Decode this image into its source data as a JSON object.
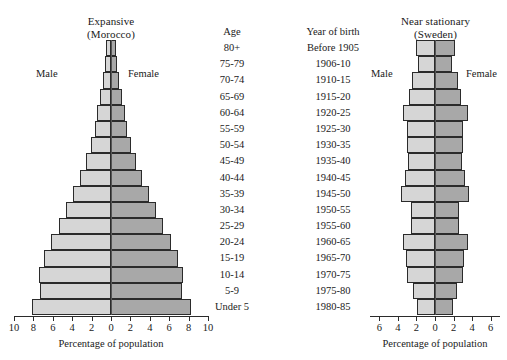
{
  "chart_data": {
    "type": "bar",
    "orientation": "horizontal-diverging",
    "panels": [
      {
        "id": "morocco",
        "title_line1": "Expansive",
        "title_line2": "(Morocco)",
        "male_label": "Male",
        "female_label": "Female",
        "xlabel": "Percentage of population",
        "xlim": [
          -10,
          10
        ],
        "xticks": [
          10,
          8,
          6,
          4,
          2,
          0,
          2,
          4,
          6,
          8,
          10
        ],
        "xtick_values": [
          -10,
          -8,
          -6,
          -4,
          -2,
          0,
          2,
          4,
          6,
          8,
          10
        ],
        "grid": false,
        "series": [
          {
            "name": "Male",
            "color": "#d6d6d6"
          },
          {
            "name": "Female",
            "color": "#a8a8a8"
          }
        ],
        "categories": [
          "80+",
          "75-79",
          "70-74",
          "65-69",
          "60-64",
          "55-59",
          "50-54",
          "45-49",
          "40-44",
          "35-39",
          "30-34",
          "25-29",
          "20-24",
          "15-19",
          "10-14",
          "5-9",
          "Under 5"
        ],
        "male_values": [
          0.5,
          0.6,
          0.8,
          1.1,
          1.4,
          1.7,
          2.1,
          2.6,
          3.2,
          3.9,
          4.6,
          5.4,
          6.2,
          6.9,
          7.4,
          7.3,
          8.1
        ],
        "female_values": [
          0.5,
          0.6,
          0.8,
          1.1,
          1.4,
          1.7,
          2.1,
          2.6,
          3.2,
          3.9,
          4.6,
          5.4,
          6.2,
          6.9,
          7.4,
          7.3,
          8.2
        ]
      },
      {
        "id": "sweden",
        "title_line1": "Near stationary",
        "title_line2": "(Sweden)",
        "male_label": "Male",
        "female_label": "Female",
        "xlabel": "Percentage of population",
        "xlim": [
          -7,
          7
        ],
        "xticks": [
          6,
          4,
          2,
          0,
          2,
          4,
          6
        ],
        "xtick_values": [
          -6,
          -4,
          -2,
          0,
          2,
          4,
          6
        ],
        "grid": false,
        "series": [
          {
            "name": "Male",
            "color": "#d6d6d6"
          },
          {
            "name": "Female",
            "color": "#a8a8a8"
          }
        ],
        "categories": [
          "Before 1905",
          "1906-10",
          "1910-15",
          "1915-20",
          "1920-25",
          "1925-30",
          "1930-35",
          "1935-40",
          "1940-45",
          "1945-50",
          "1950-55",
          "1955-60",
          "1960-65",
          "1965-70",
          "1970-75",
          "1975-80",
          "1980-85"
        ],
        "male_values": [
          2.1,
          1.8,
          2.5,
          2.8,
          3.5,
          3.0,
          3.0,
          2.9,
          3.2,
          3.7,
          2.6,
          2.6,
          3.5,
          3.1,
          3.0,
          2.4,
          1.9
        ],
        "female_values": [
          2.1,
          1.8,
          2.5,
          2.8,
          3.5,
          3.0,
          3.0,
          2.9,
          3.2,
          3.7,
          2.6,
          2.6,
          3.5,
          3.1,
          3.0,
          2.4,
          1.9
        ]
      }
    ],
    "age_column": {
      "header": "Age",
      "rows": [
        "80+",
        "75-79",
        "70-74",
        "65-69",
        "60-64",
        "55-59",
        "50-54",
        "45-49",
        "40-44",
        "35-39",
        "30-34",
        "25-29",
        "20-24",
        "15-19",
        "10-14",
        "5-9",
        "Under 5"
      ]
    },
    "year_column": {
      "header": "Year of birth",
      "rows": [
        "Before 1905",
        "1906-10",
        "1910-15",
        "1915-20",
        "1920-25",
        "1925-30",
        "1930-35",
        "1935-40",
        "1940-45",
        "1945-50",
        "1950-55",
        "1955-60",
        "1960-65",
        "1965-70",
        "1970-75",
        "1975-80",
        "1980-85"
      ]
    },
    "colors": {
      "male_fill": "#d6d6d6",
      "female_fill": "#a8a8a8",
      "stroke": "#2b2b2b",
      "background": "#ffffff",
      "text": "#1a1a1a"
    }
  }
}
